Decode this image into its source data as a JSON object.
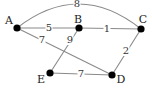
{
  "diagram": {
    "type": "weighted-undirected-graph",
    "nodes": [
      {
        "id": "A",
        "label": "A",
        "x": 17,
        "y": 28,
        "lx": 9,
        "ly": 21
      },
      {
        "id": "B",
        "label": "B",
        "x": 79,
        "y": 28,
        "lx": 78,
        "ly": 20
      },
      {
        "id": "C",
        "label": "C",
        "x": 141,
        "y": 29,
        "lx": 143,
        "ly": 20
      },
      {
        "id": "D",
        "label": "D",
        "x": 112,
        "y": 75,
        "lx": 121,
        "ly": 80
      },
      {
        "id": "E",
        "label": "E",
        "x": 50,
        "y": 73,
        "lx": 41,
        "ly": 80
      }
    ],
    "edges": [
      {
        "from": "A",
        "to": "C",
        "weight": "8",
        "curved": true,
        "lx": 77,
        "ly": 4
      },
      {
        "from": "A",
        "to": "B",
        "weight": "5",
        "curved": false,
        "lx": 49,
        "ly": 28
      },
      {
        "from": "B",
        "to": "C",
        "weight": "1",
        "curved": false,
        "lx": 107,
        "ly": 29
      },
      {
        "from": "A",
        "to": "D",
        "weight": "7",
        "curved": false,
        "lx": 42,
        "ly": 40
      },
      {
        "from": "B",
        "to": "E",
        "weight": "9",
        "curved": false,
        "lx": 70,
        "ly": 40
      },
      {
        "from": "C",
        "to": "D",
        "weight": "2",
        "curved": false,
        "lx": 126,
        "ly": 51
      },
      {
        "from": "E",
        "to": "D",
        "weight": "7",
        "curved": false,
        "lx": 81,
        "ly": 74
      }
    ]
  }
}
